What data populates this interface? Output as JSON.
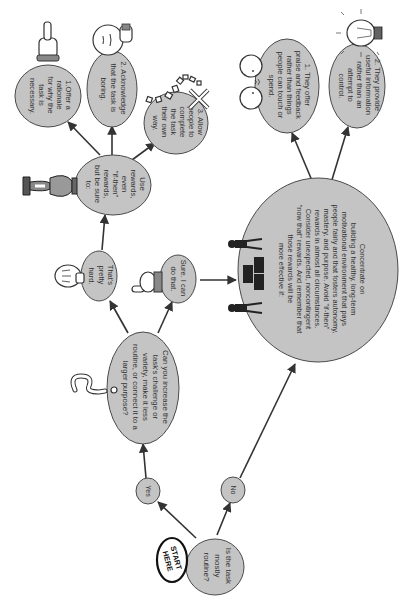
{
  "diagram": {
    "orientation": "rotated-90-clockwise",
    "colors": {
      "node_fill": "#c4c4c4",
      "node_stroke": "#4a4a4a",
      "edge": "#333333",
      "text": "#333333",
      "background": "#ffffff"
    },
    "start_badge": {
      "line1": "START",
      "line2": "HERE"
    },
    "nodes": {
      "start": {
        "lines": [
          "Is the task",
          "mostly",
          "routine?"
        ]
      },
      "yes": {
        "lines": [
          "Yes"
        ]
      },
      "no": {
        "lines": [
          "No"
        ]
      },
      "increase_challenge": {
        "lines": [
          "Can you increase the",
          "task's challenge or",
          "variety, make it less",
          "routine, or connect it to a",
          "larger purpose?"
        ]
      },
      "pretty_hard": {
        "lines": [
          "That's",
          "pretty",
          "hard."
        ]
      },
      "sure": {
        "lines": [
          "Sure. I can",
          "do that."
        ]
      },
      "use_rewards": {
        "lines": [
          "Use",
          "rewards,",
          "even",
          "\"if-then\"",
          "rewards,",
          "but be sure",
          "to:"
        ]
      },
      "rationale": {
        "lines": [
          "1.Offer a",
          "rationale",
          "for why the",
          "task is",
          "necessary."
        ]
      },
      "acknowledge": {
        "lines": [
          "2. Acknowledge",
          "that the task is",
          "boring."
        ]
      },
      "allow": {
        "lines": [
          "3. Allow",
          "people to",
          "complete",
          "the task",
          "their own",
          "way."
        ]
      },
      "concentrate": {
        "lines": [
          "Concentrate on",
          "building a healthy, long-term",
          "motivational environment that pays",
          "people fairly and that fosters autonomy,",
          "mastery, and purpose. Avoid \"if-then\"",
          "rewards in almost all circumstances.",
          "Consider unexpected, noncontingent",
          "\"now that\" rewards. And remember that",
          "those rewards will be",
          "more effective if:"
        ]
      },
      "praise": {
        "lines": [
          "1. They offer",
          "praise and feedback",
          "rather than things",
          "people can touch or",
          "spend."
        ]
      },
      "information": {
        "lines": [
          "2. They provide",
          "useful information",
          "rather than an",
          "attempt to",
          "control."
        ]
      }
    },
    "edges": [
      {
        "from": "start",
        "to": "yes"
      },
      {
        "from": "start",
        "to": "no"
      },
      {
        "from": "yes",
        "to": "increase_challenge"
      },
      {
        "from": "increase_challenge",
        "to": "pretty_hard"
      },
      {
        "from": "increase_challenge",
        "to": "sure"
      },
      {
        "from": "pretty_hard",
        "to": "use_rewards"
      },
      {
        "from": "use_rewards",
        "to": "rationale"
      },
      {
        "from": "use_rewards",
        "to": "acknowledge"
      },
      {
        "from": "use_rewards",
        "to": "allow"
      },
      {
        "from": "sure",
        "to": "concentrate"
      },
      {
        "from": "no",
        "to": "concentrate"
      },
      {
        "from": "concentrate",
        "to": "praise"
      },
      {
        "from": "concentrate",
        "to": "information"
      }
    ],
    "illustrations": [
      "pointing-hand-icon",
      "thinking-face-icon",
      "scattered-paper-icon",
      "trophy-icon",
      "thumbs-hand-icon",
      "pointing-hand-right-icon",
      "question-mark-icon",
      "meeting-people-icon",
      "talking-faces-icon",
      "light-bulb-icon"
    ]
  }
}
